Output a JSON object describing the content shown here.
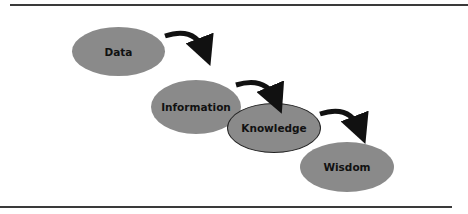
{
  "diagram": {
    "type": "hierarchy-flow",
    "nodes": [
      {
        "id": "data",
        "label": "Data",
        "highlighted": false
      },
      {
        "id": "information",
        "label": "Information",
        "highlighted": false
      },
      {
        "id": "knowledge",
        "label": "Knowledge",
        "highlighted": true
      },
      {
        "id": "wisdom",
        "label": "Wisdom",
        "highlighted": false
      }
    ],
    "edges": [
      {
        "from": "data",
        "to": "information"
      },
      {
        "from": "information",
        "to": "knowledge"
      },
      {
        "from": "knowledge",
        "to": "wisdom"
      }
    ],
    "colors": {
      "node_fill": "#8a8a8a",
      "arrow": "#111111",
      "rule": "#3a3a3a",
      "outline": "#222222"
    }
  }
}
